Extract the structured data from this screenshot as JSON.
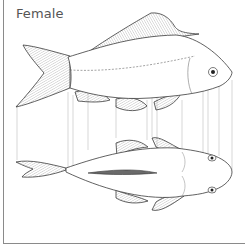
{
  "figure": {
    "title": "Female",
    "views": [
      {
        "name": "lateral view",
        "orientation": "side"
      },
      {
        "name": "ventral view",
        "orientation": "underside"
      }
    ],
    "colors": {
      "outline": "#3a3a3a",
      "fin_hatch": "#9a9a9a",
      "guide_lines": "#b5b5b5",
      "border": "#8a8a8a",
      "title": "#555555"
    }
  }
}
